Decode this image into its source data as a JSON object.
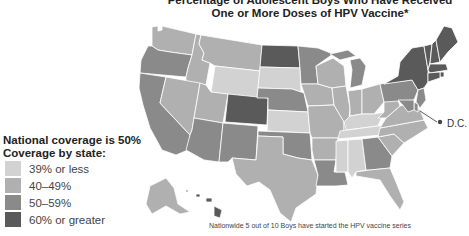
{
  "title": {
    "line1": "Percentage of Adolescent Boys Who Have Received",
    "line2": "One or More Doses of HPV Vaccine*"
  },
  "legend": {
    "heading1": "National coverage is 50%",
    "heading2": "Coverage by state:",
    "items": [
      {
        "label": "39% or less",
        "color": "#d2d2d2",
        "category": "low"
      },
      {
        "label": "40–49%",
        "color": "#b0b0b0",
        "category": "midlow"
      },
      {
        "label": "50–59%",
        "color": "#8a8a8a",
        "category": "midhigh"
      },
      {
        "label": "60% or greater",
        "color": "#5a5a5a",
        "category": "high"
      }
    ]
  },
  "dc_label": "D.C.",
  "footnote": "Nationwide 5 out of 10 Boys have started the HPV vaccine series",
  "chart_data": {
    "type": "choropleth",
    "national_coverage_percent": 50,
    "bins": [
      "39% or less",
      "40–49%",
      "50–59%",
      "60% or greater"
    ],
    "states": {
      "WA": "40–49%",
      "OR": "50–59%",
      "CA": "50–59%",
      "ID": "40–49%",
      "NV": "40–49%",
      "MT": "40–49%",
      "WY": "39% or less",
      "UT": "40–49%",
      "AZ": "50–59%",
      "CO": "60% or greater",
      "NM": "50–59%",
      "ND": "60% or greater",
      "SD": "39% or less",
      "NE": "50–59%",
      "KS": "39% or less",
      "OK": "50–59%",
      "TX": "40–49%",
      "MN": "50–59%",
      "IA": "40–49%",
      "MO": "40–49%",
      "AR": "40–49%",
      "LA": "50–59%",
      "WI": "40–49%",
      "IL": "40–49%",
      "MI": "50–59%",
      "IN": "40–49%",
      "OH": "40–49%",
      "KY": "39% or less",
      "TN": "39% or less",
      "MS": "39% or less",
      "AL": "39% or less",
      "GA": "50–59%",
      "FL": "40–49%",
      "SC": "40–49%",
      "NC": "40–49%",
      "VA": "40–49%",
      "WV": "40–49%",
      "PA": "50–59%",
      "NY": "60% or greater",
      "VT": "60% or greater",
      "NH": "60% or greater",
      "ME": "60% or greater",
      "MA": "60% or greater",
      "RI": "60% or greater",
      "CT": "60% or greater",
      "NJ": "50–59%",
      "DE": "50–59%",
      "MD": "50–59%",
      "DC": "60% or greater",
      "AK": "40–49%",
      "HI": "60% or greater"
    }
  }
}
